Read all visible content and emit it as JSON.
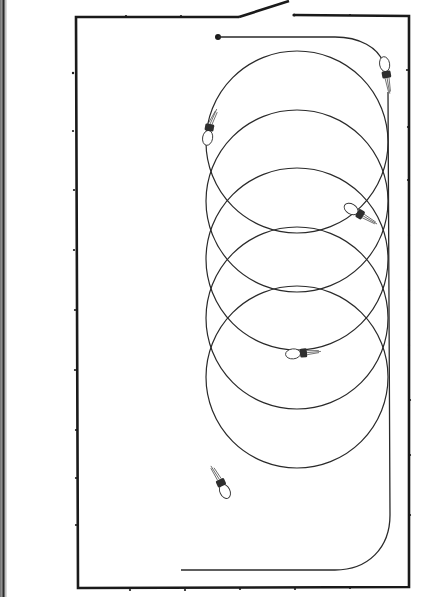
{
  "diagram": {
    "type": "circuit-illustration",
    "colors": {
      "background": "#ffffff",
      "line": "#1a1a1a"
    },
    "frame": {
      "left": 76,
      "top": 16,
      "right": 409,
      "bottom": 588
    },
    "switch": {
      "state": "open",
      "pivot": [
        239,
        17
      ],
      "lever_end": [
        289,
        1
      ],
      "contact": [
        294,
        15
      ]
    },
    "terminal_dot": [
      218,
      37
    ],
    "coil": {
      "center_x": 297,
      "radius": 90,
      "loop_count": 5,
      "loop_centers_y": [
        142,
        200,
        258,
        318,
        377
      ]
    },
    "bulbs": [
      {
        "id": "bulb-1",
        "x": 386,
        "y": 72
      },
      {
        "id": "bulb-2",
        "x": 209,
        "y": 130
      },
      {
        "id": "bulb-3",
        "x": 358,
        "y": 215
      },
      {
        "id": "bulb-4",
        "x": 302,
        "y": 353
      },
      {
        "id": "bulb-5",
        "x": 221,
        "y": 483
      }
    ],
    "return_wire": {
      "x": 390,
      "bottom_y": 570,
      "end_x": 181
    }
  }
}
